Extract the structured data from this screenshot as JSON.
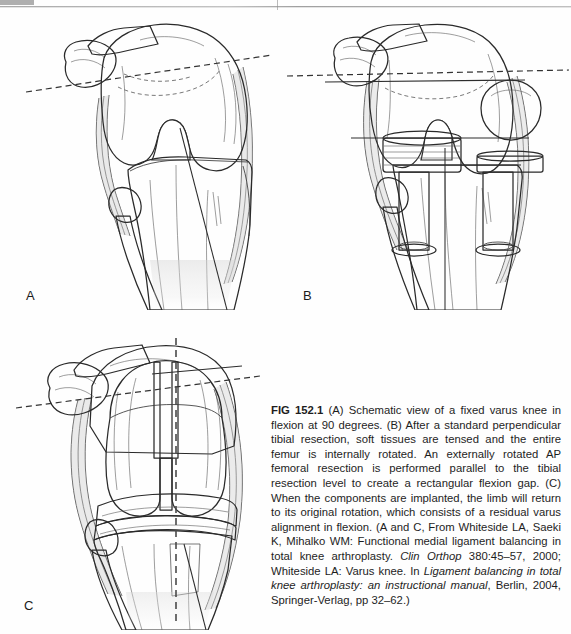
{
  "figure": {
    "id": "FIG 152.1",
    "panels": [
      {
        "label": "A",
        "name": "schematic-fixed-varus-knee-flexion",
        "description": "Schematic view of a fixed varus knee in flexion at 90 degrees",
        "annotations": [
          "posterior condylar dashed reference line",
          "solid tibial mechanical axis line"
        ]
      },
      {
        "label": "B",
        "name": "tensed-tibial-resection-internal-rotation",
        "description": "After a standard perpendicular tibial resection, soft tissues are tensed and the entire femur is internally rotated",
        "annotations": [
          "dashed epicondylar line",
          "solid external rotation resection line",
          "tensor spacer blocks",
          "tibial resection level line"
        ]
      },
      {
        "label": "C",
        "name": "implanted-components-residual-varus",
        "description": "When the components are implanted, the limb will return to its original rotation, residual varus alignment in flexion",
        "annotations": [
          "vertical dashed alignment axis",
          "dashed reference line",
          "femoral component",
          "polyethylene insert",
          "tibial tray"
        ]
      }
    ],
    "caption": {
      "prefix": "FIG 152.1",
      "segments": [
        {
          "text": " (A) Schematic view of a fixed varus knee in flexion at 90 degrees. (B) After a standard perpendicular tibial resection, soft tissues are tensed and the entire femur is internally rotated. An externally rotated AP femoral resection is performed parallel to the tibial resection level to create a rectangular flexion gap. (C) When the components are implanted, the limb will return to its original rotation, which consists of a residual varus alignment in flexion. (A and C, From Whiteside LA, Saeki K, Mihalko WM: Functional medial ligament balancing in total knee arthroplasty. ",
          "style": "normal"
        },
        {
          "text": "Clin Orthop",
          "style": "italic"
        },
        {
          "text": " 380:45–57, 2000; Whiteside LA: Varus knee. In ",
          "style": "normal"
        },
        {
          "text": "Ligament balancing in total knee arthroplasty: an instructional manual",
          "style": "italic"
        },
        {
          "text": ", Berlin, 2004, Springer-Verlag, pp 32–62.)",
          "style": "normal"
        }
      ]
    }
  },
  "colors": {
    "background": "#fefefe",
    "bone_light": "#efefef",
    "bone_mid": "#d6d6d6",
    "bone_shadow": "#a9a9a9",
    "outline": "#2a2a2a",
    "implant_dark": "#4a4a4a",
    "implant_highlight": "#cfcfcf",
    "text": "#1d1d1d"
  }
}
